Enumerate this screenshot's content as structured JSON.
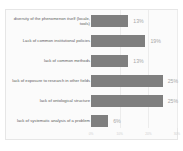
{
  "chart_data": {
    "type": "bar",
    "orientation": "horizontal",
    "title": "",
    "xlabel": "",
    "ylabel": "",
    "xlim": [
      0,
      30
    ],
    "grid": true,
    "legend": false,
    "categories": [
      "diversity of the phenomenon itself (locale, tools)",
      "Lack of common institutional policies",
      "lack of common methods",
      "lack of exposure to research in other fields",
      "lack of ontological structure",
      "lack of systematic analysis of a problem"
    ],
    "values": [
      13,
      19,
      13,
      25,
      25,
      6
    ],
    "value_labels": [
      "13%",
      "19%",
      "13%",
      "25%",
      "25%",
      "6%"
    ],
    "xticks": [
      0,
      10,
      20,
      30
    ],
    "xtick_labels": [
      "0%",
      "10%",
      "20%",
      "30%"
    ],
    "bar_color": "#7f7f7f",
    "value_label_color": "#a8a8a8",
    "category_label_color": "#5a5a5a",
    "plot_background": "#fbfbfb",
    "gridline_color": "#ececec"
  }
}
